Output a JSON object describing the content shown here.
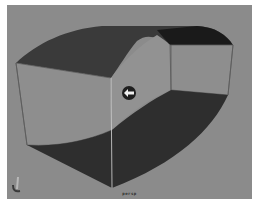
{
  "viewport": {
    "camera_label": "persp",
    "background_color": "#8b8b8b",
    "colors": {
      "top_face": "#3a3a3a",
      "top_right_face": "#1a1a1a",
      "bottom_face": "#2e2e2e",
      "side_face": "#8e8e8e",
      "edge": "#5c5c5c",
      "highlight_edge": "#d8d8d8",
      "manipulator": "#1e1e1e"
    },
    "manipulator_icon": "left-arrow-icon",
    "axis_icon": "axis-indicator-icon"
  }
}
